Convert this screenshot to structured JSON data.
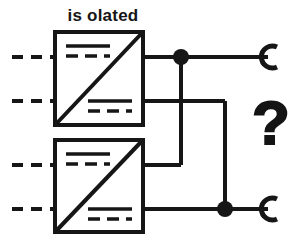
{
  "figure": {
    "title_label": "is olated",
    "unknown_marker": "?",
    "stroke_color": "#161616",
    "background_color": "#ffffff"
  },
  "converters": [
    {
      "id": "top-converter",
      "name": "isolated-dc-dc-converter-top",
      "box": {
        "x": 55,
        "y": 32,
        "width": 88,
        "height": 93
      },
      "diagonal": "bottom-left-to-top-right",
      "dc_symbol_top": {
        "x": 66,
        "y": 44,
        "width": 44
      },
      "dc_symbol_bottom": {
        "x": 88,
        "y": 100,
        "width": 44
      },
      "input_terminals": [
        {
          "name": "input-terminal-1",
          "y": 57
        },
        {
          "name": "input-terminal-2",
          "y": 101
        }
      ],
      "output_terminals": [
        {
          "name": "output-terminal-1",
          "y": 57
        },
        {
          "name": "output-terminal-2",
          "y": 101
        }
      ]
    },
    {
      "id": "bottom-converter",
      "name": "isolated-dc-dc-converter-bottom",
      "box": {
        "x": 55,
        "y": 140,
        "width": 88,
        "height": 92
      },
      "diagonal": "bottom-left-to-top-right",
      "dc_symbol_top": {
        "x": 66,
        "y": 152,
        "width": 44
      },
      "dc_symbol_bottom": {
        "x": 88,
        "y": 208,
        "width": 44
      },
      "input_terminals": [
        {
          "name": "input-terminal-3",
          "y": 165
        },
        {
          "name": "input-terminal-4",
          "y": 209
        }
      ],
      "output_terminals": [
        {
          "name": "output-terminal-3",
          "y": 165
        },
        {
          "name": "output-terminal-4",
          "y": 209
        }
      ]
    }
  ],
  "junctions": [
    {
      "name": "junction-node-top",
      "x": 181,
      "y": 57
    },
    {
      "name": "junction-node-bottom",
      "x": 225,
      "y": 209
    }
  ],
  "load_terminals": [
    {
      "name": "load-terminal-top",
      "x": 270,
      "y": 57
    },
    {
      "name": "load-terminal-bottom",
      "x": 270,
      "y": 209
    }
  ],
  "nets": [
    {
      "name": "net-top-output-positive",
      "from": "top-converter.out1",
      "to": "load-terminal-top"
    },
    {
      "name": "net-top-output-negative",
      "from": "top-converter.out2",
      "to": "junction-node-bottom"
    },
    {
      "name": "net-bottom-output-positive",
      "from": "bottom-converter.out3",
      "to": "junction-node-top"
    },
    {
      "name": "net-bottom-output-negative",
      "from": "bottom-converter.out4",
      "to": "load-terminal-bottom"
    }
  ]
}
